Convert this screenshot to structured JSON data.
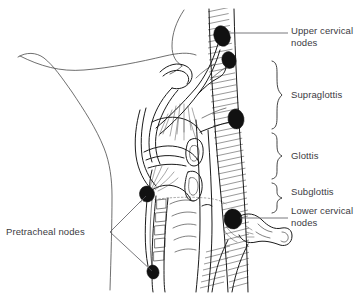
{
  "figure": {
    "width": 362,
    "height": 293,
    "background_color": "#ffffff",
    "ink_color": "#1b1b1b",
    "node_color": "#111111",
    "text_color": "#3b3b3f"
  },
  "labels": {
    "upper_cervical_nodes": "Upper cervical\nnodes",
    "supraglottis": "Supraglottis",
    "glottis": "Glottis",
    "subglottis": "Subglottis",
    "lower_cervical_nodes": "Lower cervical\nnodes",
    "pretracheal_nodes": "Pretracheal nodes"
  },
  "regions": [
    {
      "name": "supraglottis",
      "label": "Supraglottis",
      "brace_top": 60,
      "brace_bottom": 130
    },
    {
      "name": "glottis",
      "label": "Glottis",
      "brace_top": 132,
      "brace_bottom": 180
    },
    {
      "name": "subglottis",
      "label": "Subglottis",
      "brace_top": 182,
      "brace_bottom": 215
    }
  ],
  "lymph_nodes": [
    {
      "name": "upper-cervical-node-1",
      "group": "upper cervical",
      "cx": 222,
      "cy": 36,
      "rx": 8,
      "ry": 10,
      "rotation": -18
    },
    {
      "name": "upper-cervical-node-2",
      "group": "upper cervical",
      "cx": 228,
      "cy": 60,
      "rx": 7,
      "ry": 8.5,
      "rotation": -18
    },
    {
      "name": "mid-cervical-node",
      "group": "middle cervical",
      "cx": 236,
      "cy": 119,
      "rx": 8,
      "ry": 10,
      "rotation": -10
    },
    {
      "name": "lower-cervical-node",
      "group": "lower cervical",
      "cx": 233,
      "cy": 219,
      "rx": 9,
      "ry": 10,
      "rotation": -8
    },
    {
      "name": "pretracheal-node-upper",
      "group": "pretracheal",
      "cx": 147,
      "cy": 194,
      "rx": 7.5,
      "ry": 8,
      "rotation": -15
    },
    {
      "name": "pretracheal-node-lower",
      "group": "pretracheal",
      "cx": 153,
      "cy": 272,
      "rx": 6,
      "ry": 7,
      "rotation": -15
    }
  ],
  "leaders": [
    {
      "name": "leader-upper-cervical",
      "from": [
        230,
        33
      ],
      "to": [
        288,
        33
      ]
    },
    {
      "name": "leader-lower-cervical",
      "from": [
        240,
        218
      ],
      "to": [
        288,
        218
      ]
    },
    {
      "name": "leader-pretracheal-upper",
      "from": [
        108,
        232
      ],
      "to": [
        146,
        196
      ]
    },
    {
      "name": "leader-pretracheal-lower",
      "from": [
        108,
        232
      ],
      "to": [
        152,
        271
      ]
    }
  ],
  "label_positions": {
    "upper_cervical_nodes": {
      "left": 291,
      "top": 25
    },
    "supraglottis": {
      "left": 291,
      "top": 89
    },
    "glottis": {
      "left": 291,
      "top": 150
    },
    "subglottis": {
      "left": 291,
      "top": 192
    },
    "lower_cervical_nodes": {
      "left": 291,
      "top": 209
    },
    "pretracheal_nodes": {
      "left": 6,
      "top": 226
    }
  }
}
